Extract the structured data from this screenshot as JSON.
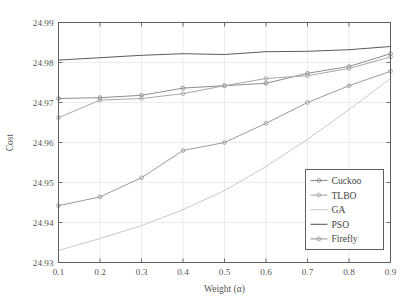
{
  "chart_data": {
    "type": "line",
    "title": "",
    "xlabel": "Weight (α)",
    "ylabel": "Cost",
    "x": [
      0.1,
      0.2,
      0.3,
      0.4,
      0.5,
      0.6,
      0.7,
      0.8,
      0.9
    ],
    "xlim": [
      0.1,
      0.9
    ],
    "ylim": [
      24.93,
      24.99
    ],
    "xticks": [
      "0.1",
      "0.2",
      "0.3",
      "0.4",
      "0.5",
      "0.6",
      "0.7",
      "0.8",
      "0.9"
    ],
    "yticks": [
      "24.93",
      "24.94",
      "24.95",
      "24.96",
      "24.97",
      "24.98",
      "24.99"
    ],
    "grid": true,
    "legend_position": "lower right",
    "series": [
      {
        "name": "Cuckoo",
        "color": "#8d8d8d",
        "marker": "circle",
        "values": [
          24.971,
          24.9712,
          24.9718,
          24.9736,
          24.9742,
          24.9748,
          24.9773,
          24.979,
          24.9822
        ]
      },
      {
        "name": "TLBO",
        "color": "#a8a8a8",
        "marker": "circle",
        "values": [
          24.9662,
          24.9706,
          24.971,
          24.9722,
          24.9742,
          24.976,
          24.9767,
          24.9785,
          24.9814
        ]
      },
      {
        "name": "GA",
        "color": "#c9c9c9",
        "marker": "none",
        "values": [
          24.933,
          24.936,
          24.9392,
          24.9432,
          24.948,
          24.954,
          24.9608,
          24.9682,
          24.976
        ]
      },
      {
        "name": "PSO",
        "color": "#5a5a5a",
        "marker": "none",
        "values": [
          24.9806,
          24.9812,
          24.9818,
          24.9822,
          24.982,
          24.9827,
          24.9828,
          24.9832,
          24.984
        ]
      },
      {
        "name": "Firefly",
        "color": "#9b9b9b",
        "marker": "circle",
        "values": [
          24.9442,
          24.9464,
          24.9512,
          24.958,
          24.96,
          24.9648,
          24.97,
          24.9742,
          24.9778
        ]
      }
    ]
  },
  "legend": {
    "items": [
      {
        "label": "Cuckoo"
      },
      {
        "label": "TLBO"
      },
      {
        "label": "GA"
      },
      {
        "label": "PSO"
      },
      {
        "label": "Firefly"
      }
    ]
  },
  "axes": {
    "x_title": "Weight (α)",
    "y_title": "Cost"
  }
}
